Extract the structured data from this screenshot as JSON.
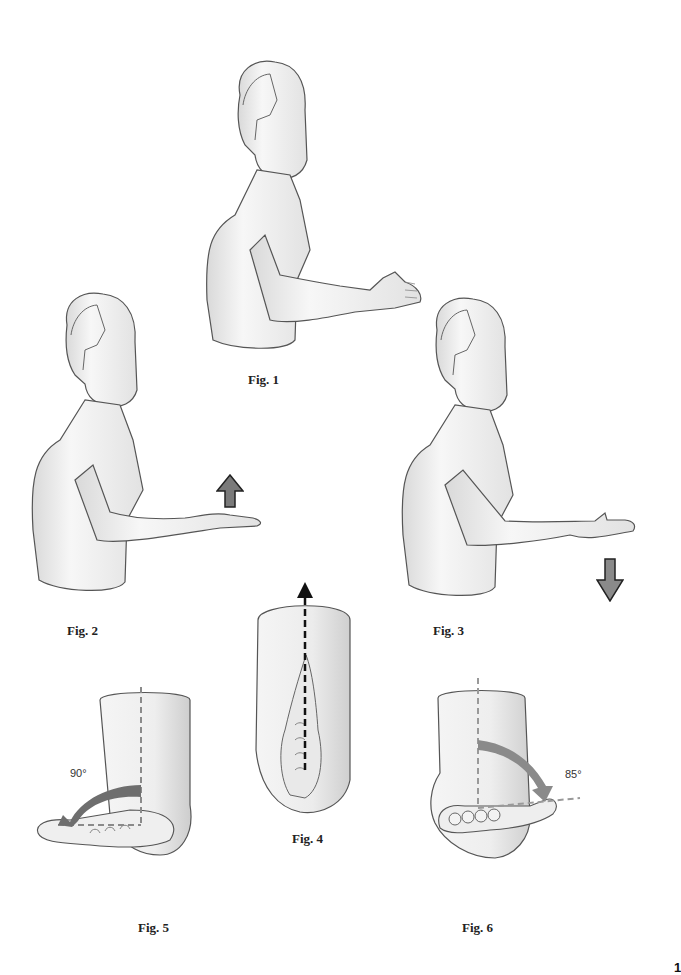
{
  "figures": [
    {
      "id": "fig1",
      "caption": "Fig. 1",
      "description": "Torso side view, arm extended forward with hand in handshake (neutral) position"
    },
    {
      "id": "fig2",
      "caption": "Fig. 2",
      "description": "Arm extended forward, palm down (pronation)",
      "arrow": "up"
    },
    {
      "id": "fig3",
      "caption": "Fig. 3",
      "description": "Arm extended forward, palm up (supination)",
      "arrow": "down"
    },
    {
      "id": "fig4",
      "caption": "Fig. 4",
      "description": "Forearm and hand viewed end-on with dashed axis arrow"
    },
    {
      "id": "fig5",
      "caption": "Fig. 5",
      "description": "Forearm rotated showing angle",
      "angle_label": "90°"
    },
    {
      "id": "fig6",
      "caption": "Fig. 6",
      "description": "Forearm rotated showing angle",
      "angle_label": "85°"
    }
  ],
  "colors": {
    "skin_fill": "#f1f1f1",
    "skin_shade": "#d6d6d6",
    "outline": "#555555",
    "arrow_fill": "#7a7a7a",
    "dash_gray": "#8a8a8a",
    "dash_black": "#111111"
  },
  "page_number": "1"
}
